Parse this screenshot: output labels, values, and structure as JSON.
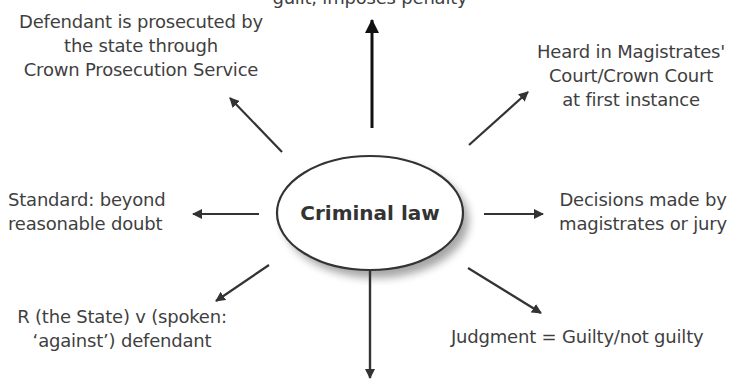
{
  "diagram": {
    "type": "spider-diagram",
    "center": {
      "label": "Criminal law"
    },
    "colors": {
      "text": "#3f3f3f",
      "arrow": "#333333",
      "ellipse_stroke": "#333333",
      "background": "#ffffff"
    },
    "nodes": {
      "top": {
        "lines": [
          "guilt, imposes penalty"
        ]
      },
      "top_left": {
        "lines": [
          "Defendant is prosecuted by",
          "the state through",
          "Crown Prosecution Service"
        ]
      },
      "top_right": {
        "lines": [
          "Heard in Magistrates'",
          "Court/Crown Court",
          "at first instance"
        ]
      },
      "left": {
        "lines": [
          "Standard: beyond",
          "reasonable doubt"
        ]
      },
      "right": {
        "lines": [
          "Decisions made by",
          "magistrates or jury"
        ]
      },
      "bottom_left": {
        "lines": [
          "R (the State) v (spoken:",
          "‘against’) defendant"
        ]
      },
      "bottom_right": {
        "lines": [
          "Judgment = Guilty/not guilty"
        ]
      }
    }
  }
}
